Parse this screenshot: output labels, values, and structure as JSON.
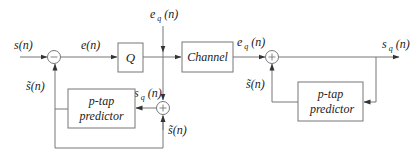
{
  "diagram": {
    "encoder": {
      "input_label": "s(n)",
      "error_label": "e(n)",
      "quantizer_label": "Q",
      "quant_error_label_main": "e",
      "quant_error_label_sub": "q",
      "quant_error_label_arg": "(n)",
      "predicted_label_left": "s̃(n)",
      "recon_label_main": "s",
      "recon_label_sub": "q",
      "recon_label_arg": "(n)",
      "predicted_label_bottom": "s̃(n)",
      "predictor_line1": "p-tap",
      "predictor_line2": "predictor",
      "junction1_sign": "minus",
      "junction2_sign": "plus"
    },
    "channel_label": "Channel",
    "decoder": {
      "input_label_main": "e",
      "input_label_sub": "q",
      "input_label_arg": "(n)",
      "predicted_label": "s̃(n)",
      "output_label_main": "s",
      "output_label_sub": "q",
      "output_label_arg": "(n)",
      "predictor_line1": "p-tap",
      "predictor_line2": "predictor",
      "junction_sign": "plus"
    }
  }
}
